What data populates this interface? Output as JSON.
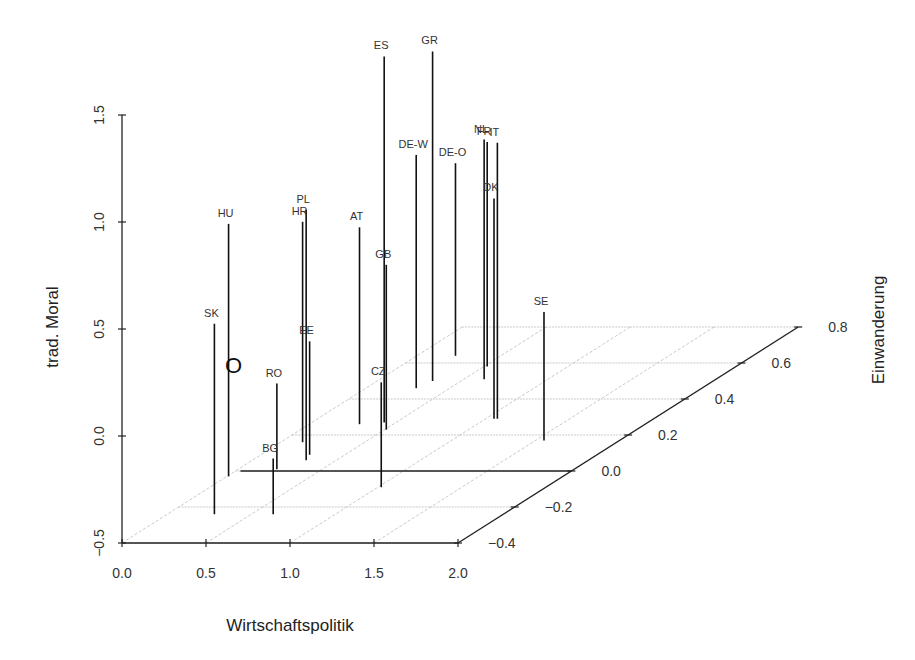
{
  "chart_data": {
    "type": "scatter3d",
    "title": "",
    "xlabel": "Wirtschaftspolitik",
    "ylabel": "Einwanderung",
    "zlabel": "trad. Moral",
    "xlim": [
      0.0,
      2.0
    ],
    "ylim": [
      -0.4,
      0.8
    ],
    "zlim": [
      -0.5,
      1.5
    ],
    "x_ticks": [
      "0.0",
      "0.5",
      "1.0",
      "1.5",
      "2.0"
    ],
    "y_ticks": [
      "−0.4",
      "−0.2",
      "0.0",
      "0.2",
      "0.4",
      "0.6",
      "0.8"
    ],
    "z_ticks": [
      "−0.5",
      "0.0",
      "0.5",
      "1.0",
      "1.5"
    ],
    "grid": true,
    "drop_lines": true,
    "reference_marker": {
      "label": "O",
      "x": 0.0,
      "y": 0.0,
      "z": 0.0
    },
    "points": [
      {
        "label": "SK",
        "x": 0.28,
        "y": -0.24,
        "z": 0.39
      },
      {
        "label": "HU",
        "x": 0.01,
        "y": -0.03,
        "z": 0.68
      },
      {
        "label": "BG",
        "x": 0.63,
        "y": -0.24,
        "z": -0.24
      },
      {
        "label": "RO",
        "x": 0.23,
        "y": 0.01,
        "z": -0.1
      },
      {
        "label": "HR",
        "x": 0.13,
        "y": 0.16,
        "z": 0.53
      },
      {
        "label": "PL",
        "x": 0.32,
        "y": 0.06,
        "z": 0.67
      },
      {
        "label": "EE",
        "x": 0.29,
        "y": 0.09,
        "z": 0.03
      },
      {
        "label": "AT",
        "x": 0.3,
        "y": 0.26,
        "z": 0.42
      },
      {
        "label": "CZ",
        "x": 1.02,
        "y": -0.09,
        "z": -0.01
      },
      {
        "label": "GB",
        "x": 0.51,
        "y": 0.23,
        "z": 0.27
      },
      {
        "label": "ES",
        "x": 0.43,
        "y": 0.27,
        "z": 1.21
      },
      {
        "label": "DE-W",
        "x": 0.3,
        "y": 0.46,
        "z": 0.59
      },
      {
        "label": "GR",
        "x": 0.33,
        "y": 0.5,
        "z": 1.04
      },
      {
        "label": "DE-O",
        "x": 0.23,
        "y": 0.64,
        "z": 0.4
      },
      {
        "label": "NL",
        "x": 0.62,
        "y": 0.51,
        "z": 0.62
      },
      {
        "label": "FR",
        "x": 0.52,
        "y": 0.58,
        "z": 0.55
      },
      {
        "label": "IT",
        "x": 1.07,
        "y": 0.29,
        "z": 0.79
      },
      {
        "label": "DK",
        "x": 1.05,
        "y": 0.29,
        "z": 0.53
      },
      {
        "label": "SE",
        "x": 1.55,
        "y": 0.17,
        "z": 0.1
      }
    ]
  },
  "projection": {
    "origin_px": [
      122,
      543
    ],
    "x_unit_px": [
      168,
      0
    ],
    "y_unit_px": [
      283.5,
      -180
    ],
    "z_unit_px": [
      0,
      -214
    ]
  },
  "colors": {
    "axis": "#222222",
    "grid": "#bbbbbb",
    "drop_line": "#111111",
    "text": "#333333"
  }
}
